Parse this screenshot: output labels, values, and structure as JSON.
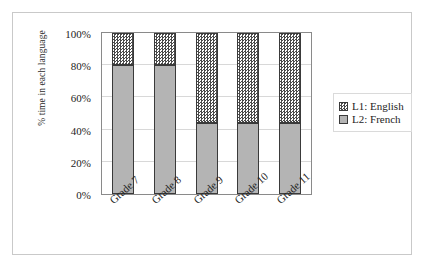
{
  "chart_data": {
    "type": "bar",
    "stacked": true,
    "stacked_mode": "percent",
    "title": "",
    "subtitle": "",
    "xlabel": "",
    "ylabel": "% time in each language",
    "categories": [
      "Grade 7",
      "Grade 8",
      "Grade 9",
      "Grade 10",
      "Grade 11"
    ],
    "series": [
      {
        "name": "L2: French",
        "values": [
          80,
          80,
          44,
          44,
          44
        ],
        "fill": "solid-gray",
        "color": "#b4b4b4"
      },
      {
        "name": "L1: English",
        "values": [
          20,
          20,
          56,
          56,
          56
        ],
        "fill": "checkerboard",
        "color": "#4a4a4a"
      }
    ],
    "ylim": [
      0,
      100
    ],
    "yticks": [
      0,
      20,
      40,
      60,
      80,
      100
    ],
    "ytick_labels": [
      "0%",
      "20%",
      "40%",
      "60%",
      "80%",
      "100%"
    ],
    "grid": true,
    "grid_axis": "y",
    "legend": {
      "position": "right",
      "entries": [
        {
          "label": "L1: English",
          "swatch": "checkerboard-swatch"
        },
        {
          "label": "L2: French",
          "swatch": "solid-gray-swatch"
        }
      ]
    },
    "xtick_rotation": -42
  }
}
